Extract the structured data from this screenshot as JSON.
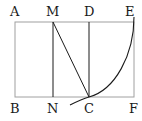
{
  "diagram": {
    "title": "",
    "points": {
      "A": {
        "label": "A",
        "x": 15,
        "y": 22
      },
      "M": {
        "label": "M",
        "x": 53,
        "y": 22
      },
      "D": {
        "label": "D",
        "x": 89,
        "y": 22
      },
      "E": {
        "label": "E",
        "x": 134,
        "y": 22
      },
      "B": {
        "label": "B",
        "x": 15,
        "y": 97
      },
      "N": {
        "label": "N",
        "x": 53,
        "y": 97
      },
      "C": {
        "label": "C",
        "x": 89,
        "y": 97
      },
      "F": {
        "label": "F",
        "x": 134,
        "y": 97
      }
    },
    "segments": [
      "A-E",
      "B-F",
      "A-B",
      "E-F",
      "M-N",
      "D-C",
      "M-C"
    ],
    "arc": {
      "from": "E",
      "through": "C",
      "description": "circular arc from E down through C extending past"
    },
    "colors": {
      "rect": "#9a9a9a",
      "lines": "#1a1a1a"
    }
  }
}
